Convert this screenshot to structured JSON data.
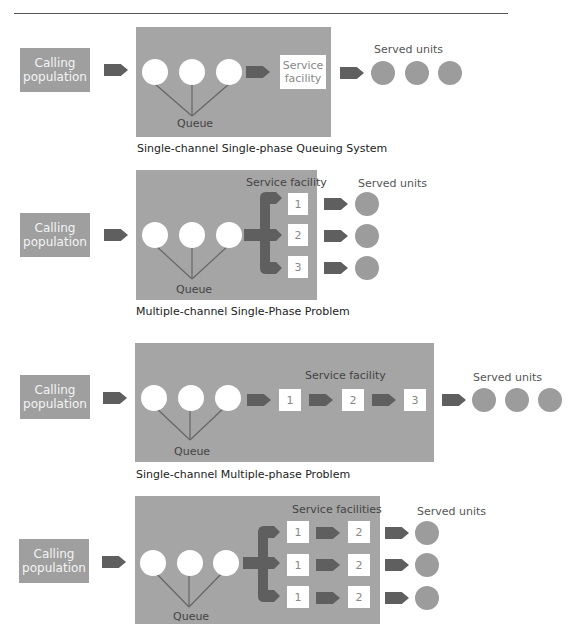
{
  "diagrams": [
    {
      "caption": "Single-channel Single-phase Queuing System",
      "calling_population": "Calling population",
      "queue_label": "Queue",
      "service_facility_label": "Service facility",
      "served_units_label": "Served units",
      "served_units_count": 3
    },
    {
      "caption": "Multiple-channel Single-Phase Problem",
      "calling_population": "Calling population",
      "queue_label": "Queue",
      "service_facility_label": "Service facility",
      "channels": [
        "1",
        "2",
        "3"
      ],
      "served_units_label": "Served units"
    },
    {
      "caption": "Single-channel Multiple-phase Problem",
      "calling_population": "Calling population",
      "queue_label": "Queue",
      "service_facility_label": "Service facility",
      "phases": [
        "1",
        "2",
        "3"
      ],
      "served_units_label": "Served units"
    },
    {
      "calling_population": "Calling population",
      "queue_label": "Queue",
      "service_facility_label": "Service facilities",
      "rows": [
        {
          "phase1": "1",
          "phase2": "2"
        },
        {
          "phase1": "1",
          "phase2": "2"
        },
        {
          "phase1": "1",
          "phase2": "2"
        }
      ],
      "served_units_label": "Served units"
    }
  ],
  "colors": {
    "panel": "#a5a5a5",
    "arrow": "#5f5f5f",
    "served_unit": "#9c9c9c",
    "queue_item": "#ffffff"
  }
}
